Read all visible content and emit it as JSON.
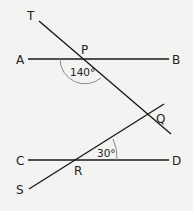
{
  "diagram": {
    "points": {
      "T": "T",
      "P": "P",
      "A": "A",
      "B": "B",
      "Q": "Q",
      "C": "C",
      "D": "D",
      "R": "R",
      "S": "S"
    },
    "angles": {
      "at_P": "140°",
      "at_R": "30°"
    },
    "lines": [
      {
        "name": "AB",
        "from": "A",
        "to": "B"
      },
      {
        "name": "CD",
        "from": "C",
        "to": "D"
      },
      {
        "name": "TQ",
        "from": "T",
        "to": "Q",
        "through": "P"
      },
      {
        "name": "SQ",
        "from": "S",
        "to": "Q",
        "through": "R"
      }
    ],
    "colors": {
      "line": "#1a1a1a",
      "arc": "#8a8a8a",
      "background": "#f3f3f1"
    }
  }
}
